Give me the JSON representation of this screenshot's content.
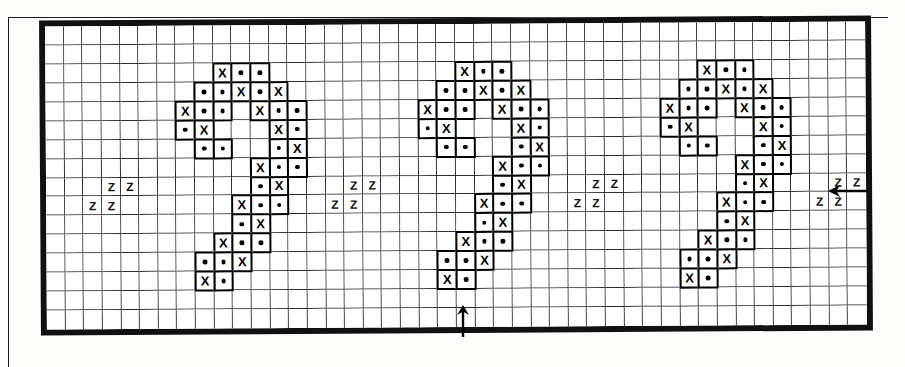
{
  "document": {
    "kind": "cross-stitch-pattern-chart",
    "title": "Cross stitch chart – repeating motif band",
    "frame_visible": true
  },
  "grid": {
    "columns": 44,
    "rows": 16,
    "cell_size_px": 18.6,
    "line_color": "#2b2b2b",
    "border_color": "#111111",
    "background": "#ffffff"
  },
  "legend": {
    "symbols": [
      {
        "key": "x",
        "glyph": "X",
        "name": "cross-symbol"
      },
      {
        "key": "dot",
        "glyph": "•",
        "name": "dot-symbol"
      },
      {
        "key": "z",
        "glyph": "Z",
        "name": "backstitch-z-symbol"
      }
    ]
  },
  "motif": {
    "name": "digit-two-motif",
    "repeat_count": 3,
    "column_offsets": [
      7,
      20,
      33
    ],
    "row_offset": 1,
    "cells": [
      {
        "r": 1,
        "c": 2,
        "s": "x"
      },
      {
        "r": 1,
        "c": 3,
        "s": "dot"
      },
      {
        "r": 1,
        "c": 4,
        "s": "dot"
      },
      {
        "r": 2,
        "c": 1,
        "s": "dot"
      },
      {
        "r": 2,
        "c": 2,
        "s": "dot"
      },
      {
        "r": 2,
        "c": 3,
        "s": "x"
      },
      {
        "r": 2,
        "c": 4,
        "s": "dot"
      },
      {
        "r": 2,
        "c": 5,
        "s": "x"
      },
      {
        "r": 3,
        "c": 0,
        "s": "x"
      },
      {
        "r": 3,
        "c": 1,
        "s": "dot"
      },
      {
        "r": 3,
        "c": 2,
        "s": "dot"
      },
      {
        "r": 3,
        "c": 4,
        "s": "x"
      },
      {
        "r": 3,
        "c": 5,
        "s": "dot"
      },
      {
        "r": 3,
        "c": 6,
        "s": "dot"
      },
      {
        "r": 4,
        "c": 0,
        "s": "dot"
      },
      {
        "r": 4,
        "c": 1,
        "s": "x"
      },
      {
        "r": 4,
        "c": 5,
        "s": "x"
      },
      {
        "r": 4,
        "c": 6,
        "s": "dot"
      },
      {
        "r": 5,
        "c": 1,
        "s": "dot"
      },
      {
        "r": 5,
        "c": 2,
        "s": "dot"
      },
      {
        "r": 5,
        "c": 5,
        "s": "dot"
      },
      {
        "r": 5,
        "c": 6,
        "s": "x"
      },
      {
        "r": 6,
        "c": 4,
        "s": "x"
      },
      {
        "r": 6,
        "c": 5,
        "s": "dot"
      },
      {
        "r": 6,
        "c": 6,
        "s": "dot"
      },
      {
        "r": 7,
        "c": 4,
        "s": "dot"
      },
      {
        "r": 7,
        "c": 5,
        "s": "x"
      },
      {
        "r": 8,
        "c": 3,
        "s": "x"
      },
      {
        "r": 8,
        "c": 4,
        "s": "dot"
      },
      {
        "r": 8,
        "c": 5,
        "s": "dot"
      },
      {
        "r": 9,
        "c": 3,
        "s": "dot"
      },
      {
        "r": 9,
        "c": 4,
        "s": "x"
      },
      {
        "r": 10,
        "c": 2,
        "s": "x"
      },
      {
        "r": 10,
        "c": 3,
        "s": "dot"
      },
      {
        "r": 10,
        "c": 4,
        "s": "dot"
      },
      {
        "r": 11,
        "c": 1,
        "s": "dot"
      },
      {
        "r": 11,
        "c": 2,
        "s": "dot"
      },
      {
        "r": 11,
        "c": 3,
        "s": "x"
      },
      {
        "r": 12,
        "c": 1,
        "s": "x"
      },
      {
        "r": 12,
        "c": 2,
        "s": "dot"
      }
    ]
  },
  "z_groups": [
    {
      "name": "z-group-1",
      "col": 2,
      "row": 8,
      "marks": [
        {
          "dr": 0,
          "dc": 1,
          "g": "Z"
        },
        {
          "dr": 0,
          "dc": 2,
          "g": "Z"
        },
        {
          "dr": 1,
          "dc": 0,
          "g": "Z"
        },
        {
          "dr": 1,
          "dc": 1,
          "g": "Z"
        }
      ]
    },
    {
      "name": "z-group-2",
      "col": 15,
      "row": 8,
      "marks": [
        {
          "dr": 0,
          "dc": 1,
          "g": "Z"
        },
        {
          "dr": 0,
          "dc": 2,
          "g": "Z"
        },
        {
          "dr": 1,
          "dc": 0,
          "g": "Z"
        },
        {
          "dr": 1,
          "dc": 1,
          "g": "Z"
        }
      ]
    },
    {
      "name": "z-group-3",
      "col": 28,
      "row": 8,
      "marks": [
        {
          "dr": 0,
          "dc": 1,
          "g": "Z"
        },
        {
          "dr": 0,
          "dc": 2,
          "g": "Z"
        },
        {
          "dr": 1,
          "dc": 0,
          "g": "Z"
        },
        {
          "dr": 1,
          "dc": 1,
          "g": "Z"
        }
      ]
    },
    {
      "name": "z-group-4",
      "col": 41,
      "row": 8,
      "marks": [
        {
          "dr": 0,
          "dc": 1,
          "g": "Z"
        },
        {
          "dr": 0,
          "dc": 2,
          "g": "Z"
        },
        {
          "dr": 1,
          "dc": 0,
          "g": "Z"
        },
        {
          "dr": 1,
          "dc": 1,
          "g": "Z"
        }
      ]
    }
  ],
  "arrows": [
    {
      "name": "center-marker-arrow-bottom",
      "direction": "up",
      "x": 455,
      "y": 303
    },
    {
      "name": "center-marker-arrow-right",
      "direction": "left",
      "x": 826,
      "y": 182
    }
  ]
}
